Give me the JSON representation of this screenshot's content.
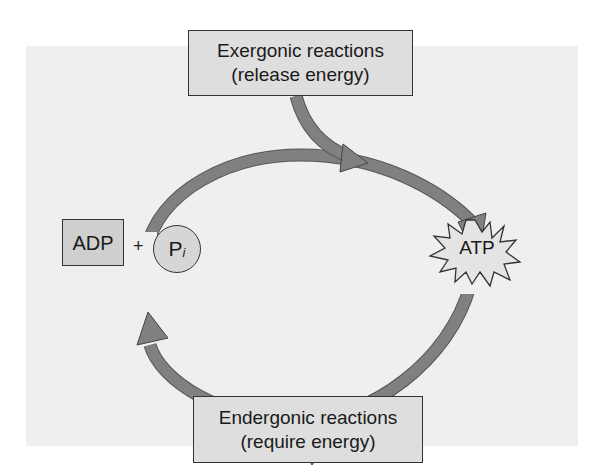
{
  "diagram": {
    "exergonic_box": {
      "line1": "Exergonic reactions",
      "line2": "(release energy)"
    },
    "endergonic_box": {
      "line1": "Endergonic reactions",
      "line2": "(require energy)"
    },
    "adp_label": "ADP",
    "plus_sign": "+",
    "pi_label": "P",
    "pi_subscript": "i",
    "atp_label": "ATP",
    "colors": {
      "panel": "#efefef",
      "box": "#dedede",
      "arrow": "#7f7f7f",
      "star": "#e4e4e4"
    }
  }
}
